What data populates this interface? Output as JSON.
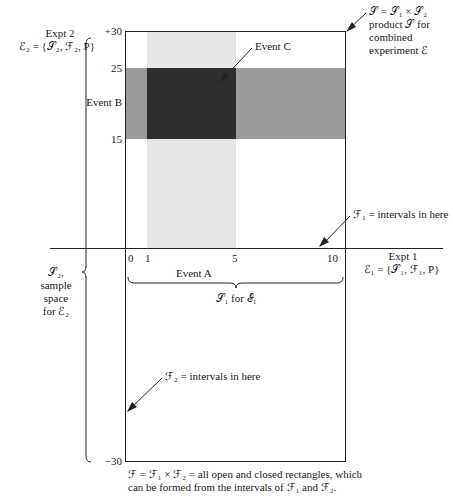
{
  "diagram": {
    "type": "product-sample-space",
    "colors": {
      "event_a_band": "#e6e6e6",
      "event_b_band": "#9a9a9a",
      "event_c_region": "#2e2e2e",
      "lines": "#222222",
      "background": "#ffffff"
    },
    "axes": {
      "x_ticks": [
        "0",
        "1",
        "5",
        "10"
      ],
      "y_ticks": [
        "+30",
        "25",
        "15",
        "−30"
      ],
      "x_range": [
        0,
        10
      ],
      "y_range": [
        -30,
        30
      ]
    },
    "events": {
      "A": {
        "label": "Event A",
        "x_interval": [
          1,
          5
        ]
      },
      "B": {
        "label": "Event B",
        "y_interval": [
          15,
          25
        ]
      },
      "C": {
        "label": "Event C",
        "region": "A × B"
      }
    }
  },
  "labels": {
    "expt2_title": "Expt 2",
    "expt2_def": "ℰ₂ = {𝒮₂, ℱ₂, P}",
    "expt1_title": "Expt 1",
    "expt1_def": "ℰ₁ = {𝒮₁, ℱ₁, P}",
    "product_line1": "𝒮 = 𝒮₁ × 𝒮₂",
    "product_line2": "product 𝒮 for",
    "product_line3": "combined",
    "product_line4": "experiment ℰ",
    "event_a": "Event A",
    "event_b": "Event B",
    "event_c": "Event C",
    "f1_note": "ℱ₁ = intervals in here",
    "f2_note": "ℱ₂ = intervals in here",
    "s1_brace": "𝒮₁ for ℰ₁",
    "s2_line1": "𝒮₂,",
    "s2_line2": "sample",
    "s2_line3": "space",
    "s2_line4": "for ℰ₂",
    "caption_line1": "ℱ = ℱ₁ × ℱ₂ = all open and closed rectangles, which",
    "caption_line2": "can be formed from the intervals of ℱ₁ and ℱ₂."
  },
  "ticks": {
    "y_top": "+30",
    "y_25": "25",
    "y_15": "15",
    "y_bottom": "−30",
    "x_0": "0",
    "x_1": "1",
    "x_5": "5",
    "x_10": "10"
  }
}
